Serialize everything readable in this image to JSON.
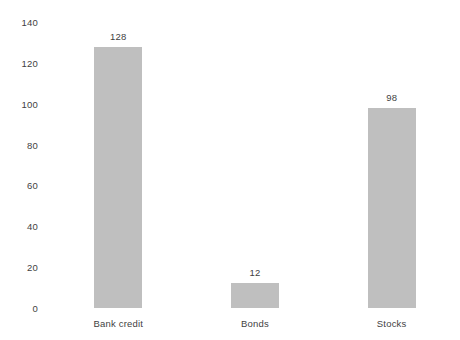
{
  "chart_data": {
    "type": "bar",
    "title": "",
    "subtitle": "",
    "xlabel": "",
    "ylabel": "",
    "categories": [
      "Bank credit",
      "Bonds",
      "Stocks"
    ],
    "values": [
      128,
      12,
      98
    ],
    "data_labels": [
      "128",
      "12",
      "98"
    ],
    "ylim": [
      0,
      140
    ],
    "ytick_values": [
      0,
      20,
      40,
      60,
      80,
      100,
      120,
      140
    ],
    "ytick_labels": [
      "0",
      "20",
      "40",
      "60",
      "80",
      "100",
      "120",
      "140"
    ],
    "grid": false,
    "legend": false,
    "legend_position": "none",
    "bar_color": "#bfbfbf",
    "text_color": "#3f3f3f",
    "background_color": "#ffffff"
  }
}
